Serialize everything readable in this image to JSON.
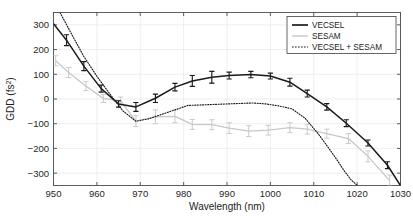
{
  "chart_data": {
    "type": "line",
    "title": "",
    "xlabel": "Wavelength (nm)",
    "ylabel": "GDD (fs2)",
    "ylabel_base": "GDD (fs",
    "ylabel_exponent": "2",
    "ylabel_suffix": ")",
    "xlim": [
      950,
      1030
    ],
    "ylim": [
      -350,
      350
    ],
    "xticks": [
      950,
      960,
      970,
      980,
      990,
      1000,
      1010,
      1020,
      1030
    ],
    "yticks": [
      300,
      200,
      100,
      0,
      -100,
      -200,
      -300
    ],
    "xtick_labels": [
      "950",
      "960",
      "970",
      "980",
      "990",
      "1000",
      "1010",
      "1020",
      "1030"
    ],
    "ytick_labels": [
      "300",
      "200",
      "100",
      "0",
      "-100",
      "-200",
      "-300"
    ],
    "grid": true,
    "legend_position": "top-right",
    "colors": {
      "vecsel": "#1a1a1a",
      "sesam": "#c8c8c8",
      "combined": "#1a1a1a",
      "grid": "#e6e6e6",
      "axis": "#4d4d4d",
      "background": "#ffffff"
    },
    "series": [
      {
        "name": "VECSEL",
        "style": "solid",
        "color": "#1a1a1a",
        "has_errorbars": true,
        "x": [
          950,
          953,
          957,
          961,
          965,
          969,
          973.5,
          978,
          982,
          986.5,
          990.5,
          995.5,
          1000,
          1004.5,
          1008.5,
          1013,
          1017.5,
          1022.5,
          1027,
          1030
        ],
        "y": [
          305,
          238,
          133,
          42,
          -20,
          -32,
          3,
          48,
          73,
          88,
          95,
          99,
          93,
          68,
          22,
          -32,
          -98,
          -178,
          -268,
          -350
        ],
        "yerr": [
          0,
          22,
          18,
          14,
          13,
          18,
          17,
          15,
          22,
          24,
          14,
          13,
          12,
          16,
          14,
          13,
          14,
          12,
          14,
          0
        ]
      },
      {
        "name": "SESAM",
        "style": "solid",
        "color": "#c8c8c8",
        "has_errorbars": true,
        "x": [
          950.5,
          953.5,
          957.5,
          961.5,
          965.5,
          969,
          973.5,
          978,
          982,
          986.5,
          990.5,
          995,
          999.5,
          1004.5,
          1008.5,
          1013,
          1018,
          1022.5,
          1027.5
        ],
        "y": [
          155,
          107,
          52,
          2,
          -8,
          -90,
          -72,
          -70,
          -103,
          -104,
          -118,
          -130,
          -126,
          -116,
          -122,
          -140,
          -160,
          -232,
          -330
        ],
        "yerr": [
          20,
          20,
          18,
          16,
          16,
          22,
          28,
          26,
          20,
          20,
          22,
          22,
          20,
          20,
          20,
          18,
          20,
          22,
          22
        ]
      },
      {
        "name": "VECSEL + SESAM",
        "style": "dotted",
        "color": "#1a1a1a",
        "has_errorbars": false,
        "x": [
          951.5,
          954,
          957,
          960,
          963,
          966,
          969,
          972,
          975,
          978,
          981,
          984,
          987,
          990,
          993,
          996,
          999,
          1002,
          1005,
          1008,
          1011,
          1013.5,
          1015.5,
          1017,
          1018.5,
          1020
        ],
        "y": [
          350,
          268,
          172,
          92,
          20,
          -48,
          -90,
          -80,
          -62,
          -44,
          -26,
          -24,
          -22,
          -20,
          -18,
          -16,
          -20,
          -28,
          -40,
          -78,
          -140,
          -200,
          -250,
          -290,
          -325,
          -350
        ]
      }
    ],
    "legend": [
      {
        "label": "VECSEL",
        "style": "solid",
        "color": "#1a1a1a"
      },
      {
        "label": "SESAM",
        "style": "solid",
        "color": "#c8c8c8"
      },
      {
        "label": "VECSEL + SESAM",
        "style": "dotted",
        "color": "#1a1a1a"
      }
    ]
  }
}
